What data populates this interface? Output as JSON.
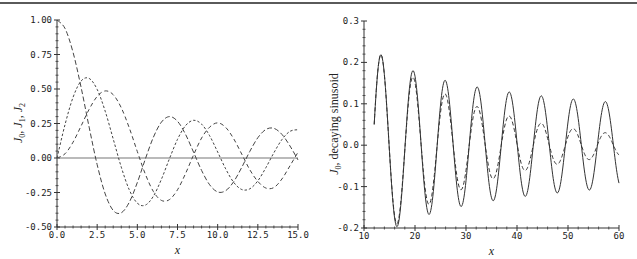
{
  "chart_data": [
    {
      "type": "line",
      "title": "",
      "xlabel": "x",
      "ylabel": "J0, J1, J2",
      "xlim": [
        0,
        15
      ],
      "ylim": [
        -0.5,
        1.0
      ],
      "xticks": [
        "0.0",
        "2.5",
        "5.0",
        "7.5",
        "10.0",
        "12.5",
        "15.0"
      ],
      "yticks": [
        "-0.50",
        "-0.25",
        "0.00",
        "0.25",
        "0.50",
        "0.75",
        "1.00"
      ],
      "grid": false,
      "legend": null,
      "zero_line": true,
      "x": [
        0,
        0.5,
        1,
        1.5,
        2,
        2.5,
        3,
        3.5,
        4,
        4.5,
        5,
        5.5,
        6,
        6.5,
        7,
        7.5,
        8,
        8.5,
        9,
        9.5,
        10,
        10.5,
        11,
        11.5,
        12,
        12.5,
        13,
        13.5,
        14,
        14.5,
        15
      ],
      "series": [
        {
          "name": "J0",
          "style": "long-dash",
          "values": [
            1.0,
            0.9385,
            0.7652,
            0.5118,
            0.2239,
            -0.0484,
            -0.2601,
            -0.3801,
            -0.3971,
            -0.3205,
            -0.1776,
            -0.0068,
            0.1506,
            0.2601,
            0.3001,
            0.2663,
            0.1717,
            0.0419,
            -0.0903,
            -0.1939,
            -0.2459,
            -0.2366,
            -0.1712,
            -0.0677,
            0.0477,
            0.1469,
            0.2069,
            0.215,
            0.1711,
            0.0875,
            -0.0142
          ]
        },
        {
          "name": "J1",
          "style": "short-dash",
          "values": [
            0.0,
            0.2423,
            0.4401,
            0.5579,
            0.5767,
            0.4971,
            0.3391,
            0.1374,
            -0.066,
            -0.2311,
            -0.3276,
            -0.3414,
            -0.2767,
            -0.1538,
            -0.0047,
            0.1352,
            0.2346,
            0.2731,
            0.2453,
            0.1613,
            0.0435,
            -0.0789,
            -0.1768,
            -0.2284,
            -0.2234,
            -0.1655,
            -0.0703,
            0.038,
            0.1334,
            0.1934,
            0.2051
          ]
        },
        {
          "name": "J2",
          "style": "dash-gap",
          "values": [
            0.0,
            0.0306,
            0.1149,
            0.2321,
            0.3528,
            0.4461,
            0.4861,
            0.4586,
            0.3641,
            0.2178,
            0.0466,
            -0.1173,
            -0.2429,
            -0.3074,
            -0.3014,
            -0.2303,
            -0.113,
            0.0223,
            0.1448,
            0.2235,
            0.2546,
            0.2215,
            0.139,
            0.0279,
            -0.0849,
            -0.1696,
            -0.2177,
            -0.214,
            -0.152,
            -0.0566,
            0.0416
          ]
        }
      ]
    },
    {
      "type": "line",
      "title": "",
      "xlabel": "x",
      "ylabel": "J0, decaying sinusoid",
      "xlim": [
        10,
        60
      ],
      "ylim": [
        -0.2,
        0.3
      ],
      "xticks": [
        "10",
        "20",
        "30",
        "40",
        "50",
        "60"
      ],
      "yticks": [
        "-0.2",
        "-0.1",
        "0.0",
        "0.1",
        "0.2",
        "0.3"
      ],
      "grid": false,
      "legend": null,
      "x_range": [
        12,
        60
      ],
      "series": [
        {
          "name": "J0",
          "style": "solid",
          "model": {
            "amp": 0.7979,
            "amp_power": -0.5,
            "decay": 0,
            "phase": -0.7854
          },
          "peaks": [
            [
              13.3,
              0.219
            ],
            [
              19.6,
              0.178
            ],
            [
              26.0,
              0.155
            ],
            [
              32.2,
              0.139
            ],
            [
              38.5,
              0.127
            ],
            [
              44.8,
              0.118
            ],
            [
              51.1,
              0.11
            ],
            [
              57.4,
              0.104
            ]
          ],
          "troughs": [
            [
              16.5,
              -0.196
            ],
            [
              22.8,
              -0.166
            ],
            [
              29.1,
              -0.146
            ],
            [
              35.4,
              -0.132
            ],
            [
              41.6,
              -0.122
            ],
            [
              47.9,
              -0.114
            ],
            [
              54.2,
              -0.107
            ]
          ]
        },
        {
          "name": "decaying sinusoid",
          "style": "dashed",
          "model": {
            "amp": 0.398,
            "amp_power": 0,
            "decay": 0.045,
            "phase": -0.7854
          },
          "peaks": [
            [
              19.6,
              0.165
            ],
            [
              26.0,
              0.124
            ],
            [
              32.2,
              0.094
            ],
            [
              38.5,
              0.071
            ],
            [
              44.8,
              0.054
            ],
            [
              51.1,
              0.04
            ],
            [
              57.4,
              0.03
            ]
          ],
          "troughs": [
            [
              22.8,
              -0.144
            ],
            [
              29.1,
              -0.109
            ],
            [
              35.4,
              -0.083
            ],
            [
              41.6,
              -0.063
            ],
            [
              47.9,
              -0.048
            ],
            [
              54.2,
              -0.036
            ]
          ]
        }
      ]
    }
  ]
}
